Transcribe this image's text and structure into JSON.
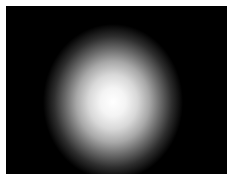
{
  "image": {
    "description": "Bright white circular light spot with soft gradient fading into a black background",
    "background_color": "#000000",
    "spot_color": "#ffffff",
    "border_color": "#ffffff"
  }
}
